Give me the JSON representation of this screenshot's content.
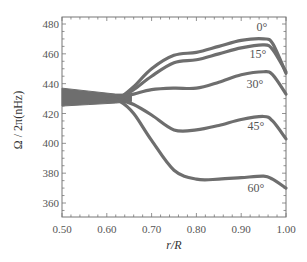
{
  "chart_data": {
    "type": "line",
    "title": "",
    "xlabel": "r/R",
    "ylabel": "Ω / 2π(nHz)",
    "xlim": [
      0.5,
      1.0
    ],
    "ylim": [
      350,
      485
    ],
    "xticks": [
      "0.50",
      "0.60",
      "0.70",
      "0.80",
      "0.90",
      "1.00"
    ],
    "yticks": [
      "360",
      "380",
      "400",
      "420",
      "440",
      "460",
      "480"
    ],
    "grid": false,
    "legend": "inline labels at right",
    "x": [
      0.5,
      0.55,
      0.6,
      0.63,
      0.66,
      0.7,
      0.75,
      0.8,
      0.85,
      0.9,
      0.95,
      0.97,
      1.0
    ],
    "series": [
      {
        "name": "0°",
        "values": [
          432,
          431,
          430,
          431,
          438,
          450,
          459,
          461,
          465,
          469,
          470,
          467,
          447
        ]
      },
      {
        "name": "15°",
        "values": [
          432,
          431,
          430,
          431,
          436,
          445,
          454,
          456,
          460,
          464,
          466,
          463,
          448
        ]
      },
      {
        "name": "30°",
        "values": [
          432,
          431,
          430,
          431,
          433,
          436,
          437,
          437,
          441,
          446,
          448,
          446,
          433
        ]
      },
      {
        "name": "45°",
        "values": [
          432,
          431,
          430,
          429,
          426,
          419,
          409,
          409,
          412,
          416,
          418,
          415,
          403
        ]
      },
      {
        "name": "60°",
        "values": [
          432,
          431,
          430,
          428,
          420,
          402,
          382,
          376,
          376,
          377,
          378,
          376,
          370
        ]
      }
    ],
    "band_width_left_nHz": 11,
    "line_color": "#6e6e6e"
  },
  "labels": {
    "xlabel": "r/R",
    "ylabel": "Ω / 2π(nHz)",
    "series": [
      "0°",
      "15°",
      "30°",
      "45°",
      "60°"
    ]
  }
}
